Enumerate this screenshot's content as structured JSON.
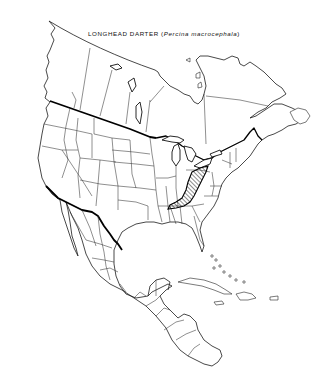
{
  "map": {
    "title": {
      "common_name": "LONGHEAD DARTER",
      "open_paren": "(",
      "scientific_name": "Percina macrocephala",
      "close_paren": ")"
    },
    "region": "North America",
    "style": "black-and-white outline map",
    "legend": {
      "range_fill": "diagonal hatching",
      "range_meaning": "species distribution range"
    },
    "colors": {
      "background": "#ffffff",
      "lines": "#000000",
      "hatch": "#000000"
    }
  }
}
